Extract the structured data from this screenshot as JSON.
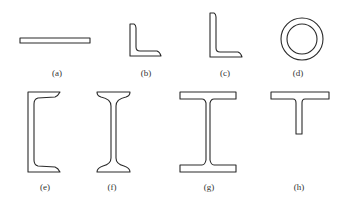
{
  "figure": {
    "stroke_color": "#2a2a2a",
    "label_color": "#333333",
    "background": "#ffffff",
    "panels": [
      {
        "id": "a",
        "label": "(a)",
        "shape": "flat-bar"
      },
      {
        "id": "b",
        "label": "(b)",
        "shape": "equal-angle"
      },
      {
        "id": "c",
        "label": "(c)",
        "shape": "unequal-angle"
      },
      {
        "id": "d",
        "label": "(d)",
        "shape": "circular-tube"
      },
      {
        "id": "e",
        "label": "(e)",
        "shape": "channel"
      },
      {
        "id": "f",
        "label": "(f)",
        "shape": "tapered-i-beam"
      },
      {
        "id": "g",
        "label": "(g)",
        "shape": "wide-flange-h-beam"
      },
      {
        "id": "h",
        "label": "(h)",
        "shape": "t-section"
      }
    ]
  }
}
